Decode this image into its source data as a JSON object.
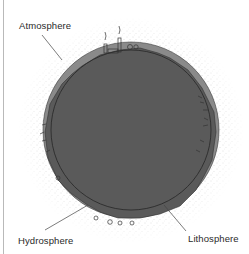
{
  "diagram": {
    "labels": {
      "atmosphere": "Atmosphere",
      "hydrosphere": "Hydrosphere",
      "lithosphere": "Lithosphere"
    },
    "colors": {
      "background": "#ffffff",
      "lithosphere_fill": "#5a5a5a",
      "hydrosphere_fill": "#8a8a8a",
      "atmosphere_stipple": "#9a9a9a",
      "outline": "#2a2a2a",
      "leader_line": "#444444"
    }
  }
}
